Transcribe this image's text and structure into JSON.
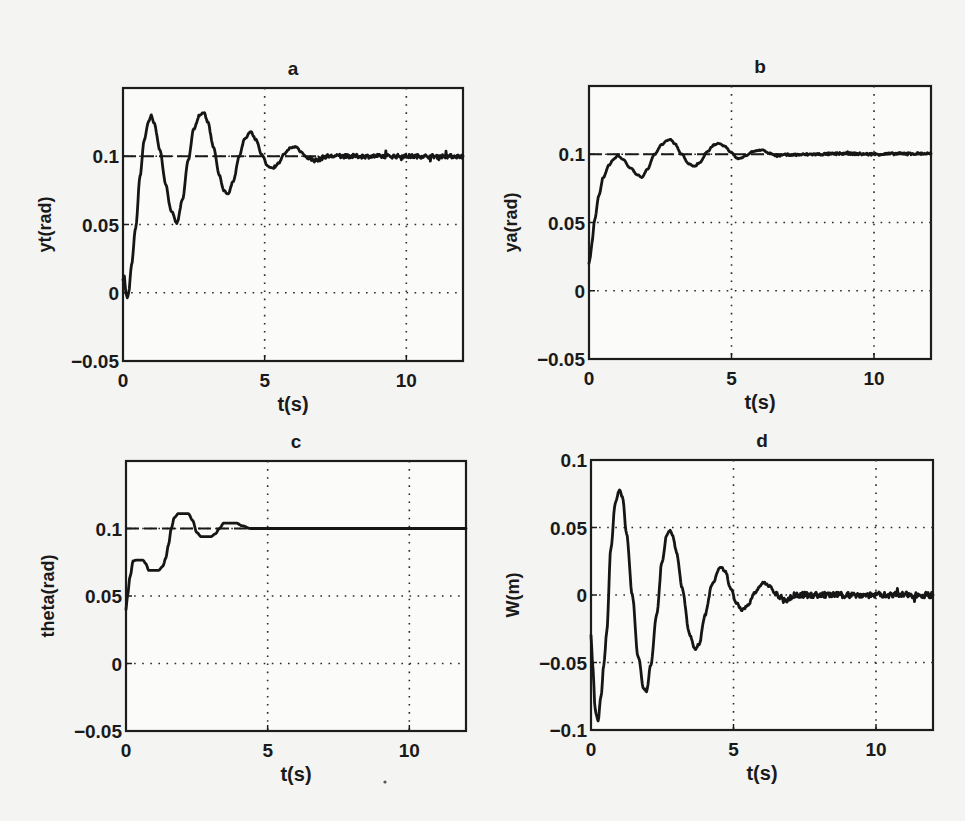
{
  "figure": {
    "background": "#f4f4f2",
    "line_color": "#161616",
    "stray_dot": {
      "x": 385,
      "y": 782
    }
  },
  "chart_data": [
    {
      "id": "a",
      "type": "line",
      "title": "a",
      "xlabel": "t(s)",
      "ylabel": "yt(rad)",
      "xlim": [
        0,
        12
      ],
      "ylim": [
        -0.05,
        0.15
      ],
      "xticks": [
        0,
        5,
        10
      ],
      "xtick_labels": [
        "0",
        "5",
        "10"
      ],
      "yticks": [
        -0.05,
        0,
        0.05,
        0.1
      ],
      "ytick_labels": [
        "-0.05",
        "0",
        "0.05",
        "0.1"
      ],
      "grid": true,
      "reference": {
        "name": "setpoint",
        "value": 0.1,
        "style": "dashed"
      },
      "noise_after_t": 6.5,
      "noise_amplitude": 0.0015,
      "box": {
        "x0": 123,
        "y0": 88,
        "x1": 463,
        "y1": 361
      },
      "series": [
        {
          "name": "yt",
          "x": [
            0,
            0.05,
            0.1,
            0.15,
            0.2,
            0.3,
            0.45,
            0.6,
            0.75,
            0.9,
            1.0,
            1.1,
            1.3,
            1.5,
            1.7,
            1.9,
            2.1,
            2.3,
            2.5,
            2.7,
            2.85,
            3.0,
            3.2,
            3.4,
            3.55,
            3.7,
            3.9,
            4.1,
            4.3,
            4.5,
            4.7,
            4.9,
            5.1,
            5.3,
            5.5,
            5.7,
            5.9,
            6.1,
            6.3,
            6.5,
            6.8,
            7.2,
            8,
            9,
            10,
            11,
            12
          ],
          "y": [
            0.01,
            0.012,
            0.0,
            -0.004,
            0.0,
            0.02,
            0.048,
            0.085,
            0.112,
            0.125,
            0.13,
            0.124,
            0.105,
            0.08,
            0.06,
            0.051,
            0.068,
            0.097,
            0.12,
            0.13,
            0.132,
            0.125,
            0.106,
            0.086,
            0.075,
            0.072,
            0.082,
            0.1,
            0.113,
            0.118,
            0.112,
            0.101,
            0.093,
            0.091,
            0.095,
            0.102,
            0.106,
            0.107,
            0.103,
            0.099,
            0.097,
            0.1,
            0.1,
            0.1,
            0.1,
            0.1,
            0.1
          ]
        }
      ]
    },
    {
      "id": "b",
      "type": "line",
      "title": "b",
      "xlabel": "t(s)",
      "ylabel": "ya(rad)",
      "xlim": [
        0,
        12
      ],
      "ylim": [
        -0.05,
        0.15
      ],
      "xticks": [
        0,
        5,
        10
      ],
      "xtick_labels": [
        "0",
        "5",
        "10"
      ],
      "yticks": [
        -0.05,
        0,
        0.05,
        0.1
      ],
      "ytick_labels": [
        "-0.05",
        "0",
        "0.05",
        "0.1"
      ],
      "grid": true,
      "reference": {
        "name": "setpoint",
        "value": 0.1,
        "style": "dashed"
      },
      "noise_after_t": 6.5,
      "noise_amplitude": 0.0009,
      "box": {
        "x0": 589,
        "y0": 86,
        "x1": 931,
        "y1": 359
      },
      "series": [
        {
          "name": "ya",
          "x": [
            0,
            0.05,
            0.1,
            0.2,
            0.35,
            0.5,
            0.7,
            0.85,
            1.0,
            1.2,
            1.45,
            1.7,
            1.85,
            2.05,
            2.3,
            2.55,
            2.75,
            2.85,
            3.0,
            3.25,
            3.5,
            3.7,
            3.9,
            4.15,
            4.4,
            4.55,
            4.75,
            5.0,
            5.2,
            5.3,
            5.5,
            5.75,
            6.0,
            6.1,
            6.3,
            6.6,
            7.0,
            8,
            9,
            10,
            11,
            12
          ],
          "y": [
            0.02,
            0.025,
            0.035,
            0.052,
            0.07,
            0.083,
            0.092,
            0.096,
            0.099,
            0.096,
            0.09,
            0.085,
            0.083,
            0.089,
            0.1,
            0.107,
            0.11,
            0.111,
            0.108,
            0.1,
            0.093,
            0.091,
            0.094,
            0.102,
            0.107,
            0.108,
            0.106,
            0.101,
            0.097,
            0.097,
            0.099,
            0.102,
            0.103,
            0.103,
            0.101,
            0.099,
            0.0995,
            0.1,
            0.1005,
            0.1,
            0.1005,
            0.1005
          ]
        }
      ]
    },
    {
      "id": "c",
      "type": "line",
      "title": "c",
      "xlabel": "t(s)",
      "ylabel": "theta(rad)",
      "xlim": [
        0,
        12
      ],
      "ylim": [
        -0.05,
        0.15
      ],
      "xticks": [
        0,
        5,
        10
      ],
      "xtick_labels": [
        "0",
        "5",
        "10"
      ],
      "yticks": [
        -0.05,
        0,
        0.05,
        0.1
      ],
      "ytick_labels": [
        "-0.05",
        "0",
        "0.05",
        "0.1"
      ],
      "grid": true,
      "reference": {
        "name": "setpoint",
        "value": 0.1,
        "style": "dashed"
      },
      "noise_after_t": 99,
      "noise_amplitude": 0,
      "box": {
        "x0": 126,
        "y0": 461,
        "x1": 466,
        "y1": 731
      },
      "series": [
        {
          "name": "theta",
          "x": [
            0,
            0.05,
            0.15,
            0.25,
            0.35,
            0.6,
            0.7,
            0.8,
            1.15,
            1.3,
            1.4,
            1.5,
            1.6,
            1.7,
            1.85,
            2.2,
            2.35,
            2.5,
            2.65,
            3.0,
            3.15,
            3.3,
            3.45,
            3.9,
            4.1,
            4.4,
            5,
            6,
            8,
            10,
            12
          ],
          "y": [
            0.04,
            0.05,
            0.065,
            0.076,
            0.0765,
            0.0765,
            0.074,
            0.069,
            0.069,
            0.072,
            0.078,
            0.088,
            0.1,
            0.108,
            0.111,
            0.111,
            0.106,
            0.097,
            0.094,
            0.094,
            0.096,
            0.1,
            0.104,
            0.104,
            0.102,
            0.1,
            0.1,
            0.1,
            0.1,
            0.1,
            0.1
          ]
        }
      ]
    },
    {
      "id": "d",
      "type": "line",
      "title": "d",
      "xlabel": "t(s)",
      "ylabel": "W(m)",
      "xlim": [
        0,
        12
      ],
      "ylim": [
        -0.1,
        0.1
      ],
      "xticks": [
        0,
        5,
        10
      ],
      "xtick_labels": [
        "0",
        "5",
        "10"
      ],
      "yticks": [
        -0.1,
        -0.05,
        0,
        0.05,
        0.1
      ],
      "ytick_labels": [
        "-0.1",
        "-0.05",
        "0",
        "0.05",
        "0.1"
      ],
      "grid": true,
      "reference": null,
      "noise_after_t": 6.5,
      "noise_amplitude": 0.0022,
      "box": {
        "x0": 591,
        "y0": 460,
        "x1": 933,
        "y1": 730
      },
      "series": [
        {
          "name": "W",
          "x": [
            0,
            0.05,
            0.15,
            0.25,
            0.35,
            0.45,
            0.55,
            0.7,
            0.85,
            1.0,
            1.1,
            1.25,
            1.45,
            1.65,
            1.85,
            1.95,
            2.1,
            2.3,
            2.5,
            2.65,
            2.75,
            2.85,
            3.0,
            3.2,
            3.45,
            3.65,
            3.8,
            4.0,
            4.25,
            4.55,
            4.7,
            4.9,
            5.1,
            5.3,
            5.5,
            5.75,
            6.05,
            6.25,
            6.5,
            6.8,
            7.2,
            8,
            9,
            10,
            11,
            12
          ],
          "y": [
            -0.03,
            -0.05,
            -0.085,
            -0.093,
            -0.075,
            -0.052,
            -0.028,
            0.035,
            0.068,
            0.078,
            0.073,
            0.045,
            0.0,
            -0.045,
            -0.069,
            -0.071,
            -0.052,
            -0.015,
            0.025,
            0.044,
            0.048,
            0.045,
            0.032,
            0.005,
            -0.028,
            -0.04,
            -0.036,
            -0.015,
            0.008,
            0.021,
            0.018,
            0.005,
            -0.006,
            -0.011,
            -0.008,
            0.002,
            0.009,
            0.007,
            0.0,
            -0.004,
            0.0,
            0.0,
            0.0,
            0.0,
            0.0,
            0.0
          ]
        }
      ]
    }
  ]
}
